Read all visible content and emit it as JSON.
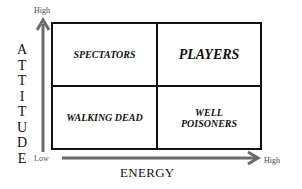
{
  "diagram": {
    "type": "2x2 quadrant matrix",
    "y_axis": {
      "title": "ATTITUDE",
      "letters": [
        "A",
        "T",
        "T",
        "I",
        "T",
        "U",
        "D",
        "E"
      ],
      "high_label": "High",
      "low_label": "Low"
    },
    "x_axis": {
      "title": "ENERGY",
      "high_label": "High"
    },
    "quadrants": {
      "top_left": "SPECTATORS",
      "top_right": "PLAYERS",
      "bottom_left": "WALKING DEAD",
      "bottom_right_line1": "WELL",
      "bottom_right_line2": "POISONERS"
    },
    "colors": {
      "axis": "#6b6b6b",
      "border": "#111111",
      "text": "#111111"
    }
  }
}
